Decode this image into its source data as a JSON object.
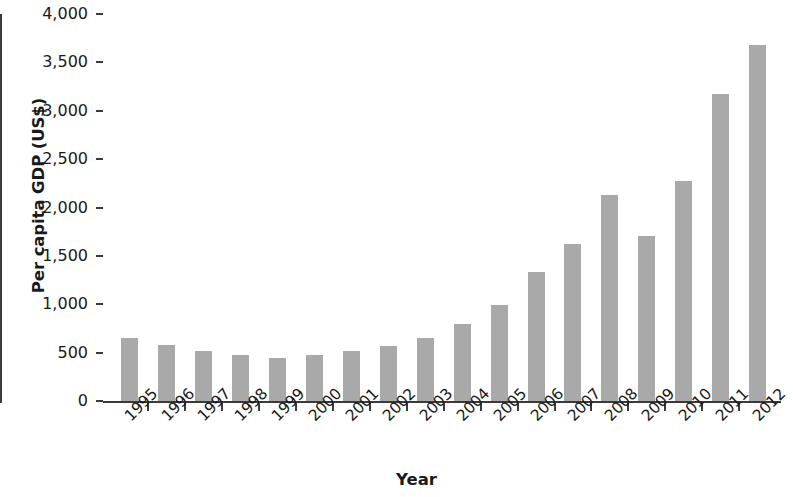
{
  "chart_data": {
    "type": "bar",
    "title": "",
    "xlabel": "Year",
    "ylabel": "Per capita GDP (US$)",
    "categories": [
      "1995",
      "1996",
      "1997",
      "1998",
      "1999",
      "2000",
      "2001",
      "2002",
      "2003",
      "2004",
      "2005",
      "2006",
      "2007",
      "2008",
      "2009",
      "2010",
      "2011",
      "2012"
    ],
    "values": [
      650,
      580,
      520,
      480,
      445,
      480,
      520,
      565,
      650,
      800,
      995,
      1330,
      1620,
      2130,
      1705,
      2270,
      3170,
      3680
    ],
    "ylim": [
      0,
      4000
    ],
    "ytick_values": [
      0,
      500,
      1000,
      1500,
      2000,
      2500,
      3000,
      3500,
      4000
    ],
    "ytick_labels": [
      "0",
      "500",
      "1,000",
      "1,500",
      "2,000",
      "2,500",
      "3,000",
      "3,500",
      "4,000"
    ],
    "grid": false,
    "legend": false,
    "legend_position": "none",
    "series": [
      {
        "name": "Per capita GDP",
        "color": "#a9a9a9",
        "values": [
          650,
          580,
          520,
          480,
          445,
          480,
          520,
          565,
          650,
          800,
          995,
          1330,
          1620,
          2130,
          1705,
          2270,
          3170,
          3680
        ]
      }
    ],
    "axis_color": "#3a3a3a",
    "text_color": "#1a1a1a",
    "background": "#ffffff"
  }
}
